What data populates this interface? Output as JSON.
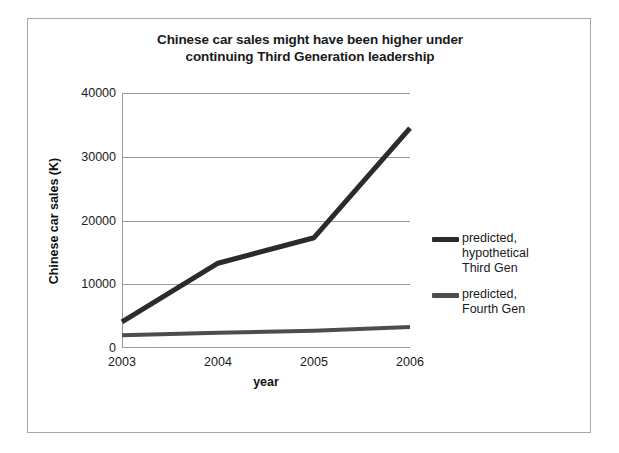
{
  "chart_data": {
    "type": "line",
    "title": "Chinese car sales might have been higher under continuing Third Generation leadership",
    "title_line1": "Chinese car sales might have been higher under",
    "title_line2": "continuing Third Generation leadership",
    "xlabel": "year",
    "ylabel": "Chinese car sales (K)",
    "categories": [
      "2003",
      "2004",
      "2005",
      "2006"
    ],
    "x": [
      2003,
      2004,
      2005,
      2006
    ],
    "ylim": [
      0,
      40000
    ],
    "yticks": [
      "0",
      "10000",
      "20000",
      "30000",
      "40000"
    ],
    "ytick_values": [
      0,
      10000,
      20000,
      30000,
      40000
    ],
    "grid": "horizontal",
    "legend_position": "right",
    "series": [
      {
        "name": "predicted, hypothetical Third Gen",
        "label_lines": "predicted,\nhypothetical\nThird Gen",
        "color": "#2b2b2b",
        "values": [
          4100,
          13300,
          17300,
          34500
        ]
      },
      {
        "name": "predicted, Fourth Gen",
        "label_lines": "predicted,\nFourth Gen",
        "color": "#4d4d4d",
        "values": [
          2000,
          2400,
          2700,
          3300
        ]
      }
    ]
  },
  "figure": {
    "border_color": "#a8a8a8",
    "background": "#ffffff",
    "axis_color": "#9a9a9a"
  }
}
